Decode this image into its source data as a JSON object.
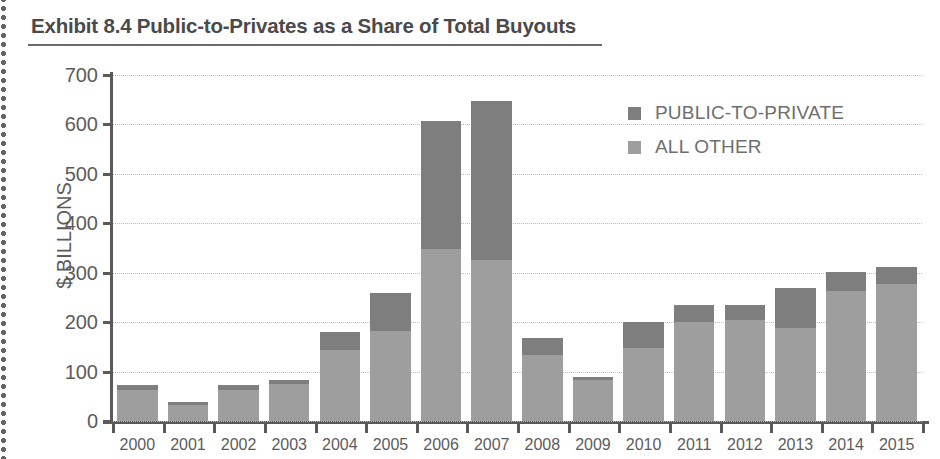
{
  "exhibit": {
    "title": "Exhibit 8.4 Public-to-Privates as a Share of Total Buyouts"
  },
  "colors": {
    "public_to_private": "#7e7e7e",
    "all_other": "#9e9e9e",
    "axis": "#5a5a5a",
    "gridline": "#bdbdbd",
    "text": "#5c5c5c",
    "title": "#4a4a4a"
  },
  "legend": {
    "position": "top-right",
    "entries": [
      {
        "label": "PUBLIC-TO-PRIVATE",
        "color": "#7e7e7e"
      },
      {
        "label": "ALL OTHER",
        "color": "#9e9e9e"
      }
    ]
  },
  "chart_data": {
    "type": "bar",
    "stacked": true,
    "title": "Exhibit 8.4 Public-to-Privates as a Share of Total Buyouts",
    "xlabel": "",
    "ylabel": "$ BILLIONS",
    "ylim": [
      0,
      700
    ],
    "ytick_labels": [
      "0",
      "100",
      "200",
      "300",
      "400",
      "500",
      "600",
      "700"
    ],
    "yticks": [
      0,
      100,
      200,
      300,
      400,
      500,
      600,
      700
    ],
    "grid": true,
    "grid_axis": "y",
    "categories": [
      "2000",
      "2001",
      "2002",
      "2003",
      "2004",
      "2005",
      "2006",
      "2007",
      "2008",
      "2009",
      "2010",
      "2011",
      "2012",
      "2013",
      "2014",
      "2015"
    ],
    "series": [
      {
        "name": "ALL OTHER",
        "color": "#9e9e9e",
        "values": [
          62,
          32,
          63,
          74,
          143,
          182,
          348,
          325,
          134,
          82,
          148,
          200,
          205,
          188,
          263,
          278
        ]
      },
      {
        "name": "PUBLIC-TO-PRIVATE",
        "color": "#7e7e7e",
        "values": [
          10,
          6,
          9,
          9,
          37,
          78,
          260,
          323,
          33,
          8,
          52,
          35,
          30,
          82,
          39,
          34
        ]
      }
    ],
    "totals": [
      72,
      38,
      72,
      83,
      180,
      260,
      608,
      648,
      167,
      90,
      200,
      235,
      235,
      270,
      302,
      312
    ]
  }
}
